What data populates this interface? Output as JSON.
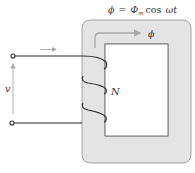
{
  "flux_equation": "ϕ = Φm cos ωt",
  "flux_equation_parts": {
    "lhs": "ϕ",
    "eq": "=",
    "amp": "Φ",
    "amp_sub": "m",
    "func": "cos",
    "arg": "ωt"
  },
  "flux_label": "ϕ",
  "turns_label": "N",
  "voltage_label": "v",
  "colors": {
    "core_fill": "#e4e4e4",
    "core_edge": "#9a9a9a",
    "wire": "#2a2a2a",
    "arrow": "#a8a8a8",
    "text": "#333333"
  },
  "components": {
    "core": {
      "outer": [
        82,
        20,
        191,
        163
      ],
      "inner": [
        105,
        44,
        168,
        136
      ]
    },
    "terminals": [
      {
        "name": "top",
        "x": 13,
        "y": 56
      },
      {
        "name": "bottom",
        "x": 12,
        "y": 123
      }
    ],
    "winding_turns": 3
  }
}
